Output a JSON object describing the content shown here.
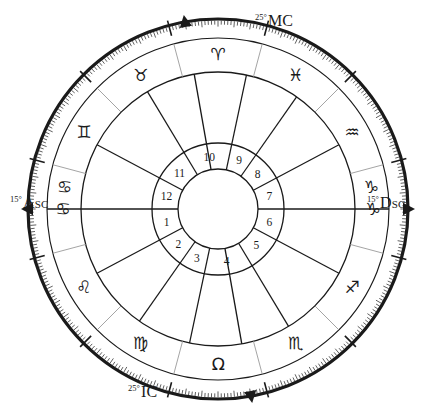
{
  "chart": {
    "type": "astrological-wheel",
    "house_system": "quadrant",
    "zodiac_signs": [
      {
        "name": "Aries",
        "glyph": "♈",
        "start_deg": 0,
        "end_deg": 30
      },
      {
        "name": "Taurus",
        "glyph": "♉",
        "start_deg": 30,
        "end_deg": 60
      },
      {
        "name": "Gemini",
        "glyph": "♊",
        "start_deg": 60,
        "end_deg": 90
      },
      {
        "name": "Cancer",
        "glyph": "♋",
        "start_deg": 90,
        "end_deg": 120
      },
      {
        "name": "Leo",
        "glyph": "♌",
        "start_deg": 120,
        "end_deg": 150
      },
      {
        "name": "Virgo",
        "glyph": "♍",
        "start_deg": 150,
        "end_deg": 180
      },
      {
        "name": "Libra",
        "glyph": "Ω",
        "start_deg": 180,
        "end_deg": 210
      },
      {
        "name": "Scorpio",
        "glyph": "♏",
        "start_deg": 210,
        "end_deg": 240
      },
      {
        "name": "Sagittarius",
        "glyph": "♐",
        "start_deg": 240,
        "end_deg": 270
      },
      {
        "name": "Capricorn",
        "glyph": "♑",
        "start_deg": 270,
        "end_deg": 300
      },
      {
        "name": "Aquarius",
        "glyph": "♒",
        "start_deg": 300,
        "end_deg": 330
      },
      {
        "name": "Pisces",
        "glyph": "♓",
        "start_deg": 330,
        "end_deg": 360
      }
    ],
    "angles": [
      {
        "id": "asc",
        "label": "Asc",
        "degree_text": "15°",
        "sign": "Cancer",
        "sign_glyph": "♋",
        "zodiac_deg": 105
      },
      {
        "id": "mc",
        "label": "MC",
        "degree_text": "25°",
        "sign": "Aries",
        "sign_glyph": "♈",
        "zodiac_deg": 25
      },
      {
        "id": "dsc",
        "label": "Dsc",
        "degree_text": "15°",
        "sign": "Capricorn",
        "sign_glyph": "♑",
        "zodiac_deg": 285
      },
      {
        "id": "ic",
        "label": "IC",
        "degree_text": "25°",
        "sign": "Libra",
        "sign_glyph": "Ω",
        "zodiac_deg": 205
      }
    ],
    "houses": [
      {
        "number": "1",
        "cusp_deg": 105,
        "end_deg": 133
      },
      {
        "number": "2",
        "cusp_deg": 133,
        "end_deg": 160
      },
      {
        "number": "3",
        "cusp_deg": 160,
        "end_deg": 183
      },
      {
        "number": "4",
        "cusp_deg": 183,
        "end_deg": 226
      },
      {
        "number": "5",
        "cusp_deg": 226,
        "end_deg": 257
      },
      {
        "number": "6",
        "cusp_deg": 257,
        "end_deg": 285
      },
      {
        "number": "7",
        "cusp_deg": 285,
        "end_deg": 313
      },
      {
        "number": "8",
        "cusp_deg": 313,
        "end_deg": 340
      },
      {
        "number": "9",
        "cusp_deg": 340,
        "end_deg": 3
      },
      {
        "number": "10",
        "cusp_deg": 3,
        "end_deg": 46
      },
      {
        "number": "11",
        "cusp_deg": 46,
        "end_deg": 77
      },
      {
        "number": "12",
        "cusp_deg": 77,
        "end_deg": 105
      }
    ],
    "colors": {
      "ink": "#1a1a1a",
      "divider": "#9a9a9a",
      "background": "#ffffff"
    }
  }
}
